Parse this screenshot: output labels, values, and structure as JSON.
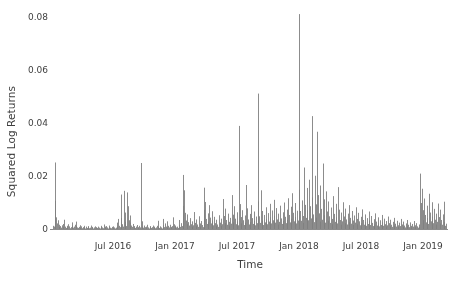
{
  "chart_data": {
    "type": "bar",
    "title": "",
    "xlabel": "Time",
    "ylabel": "Squared Log Returns",
    "ylim": [
      0,
      0.085
    ],
    "ytick_values": [
      0,
      0.02,
      0.04,
      0.06,
      0.08
    ],
    "ytick_labels": [
      "0",
      "0.02",
      "0.04",
      "0.06",
      "0.08"
    ],
    "xtick_labels": [
      "Jul 2016",
      "Jan 2017",
      "Jul 2017",
      "Jan 2018",
      "Jul 2018",
      "Jan 2019"
    ],
    "xtick_positions": [
      113,
      175,
      237,
      299,
      361,
      423
    ],
    "x_range_px": [
      53,
      446
    ],
    "grid": false,
    "legend": null,
    "series_color": "#7f7f7f",
    "axis_color": "#8c8c8c",
    "series": [
      {
        "name": "Squared Log Returns",
        "values": [
          0.0012,
          0.0009,
          0.0106,
          0.0251,
          0.0044,
          0.0021,
          0.0033,
          0.0016,
          0.0008,
          0.0011,
          0.0005,
          0.0014,
          0.0007,
          0.0019,
          0.0035,
          0.0009,
          0.0004,
          0.0012,
          0.0006,
          0.0018,
          0.001,
          0.0003,
          0.0007,
          0.0025,
          0.0013,
          0.0005,
          0.0009,
          0.0016,
          0.0028,
          0.0011,
          0.0006,
          0.0004,
          0.0008,
          0.0014,
          0.0005,
          0.001,
          0.0003,
          0.0007,
          0.0012,
          0.0006,
          0.0002,
          0.0009,
          0.0004,
          0.0011,
          0.0007,
          0.0003,
          0.0005,
          0.0013,
          0.0008,
          0.0004,
          0.0002,
          0.0006,
          0.001,
          0.0003,
          0.0007,
          0.0004,
          0.0009,
          0.0005,
          0.0002,
          0.0008,
          0.0012,
          0.0006,
          0.0003,
          0.0017,
          0.0009,
          0.0004,
          0.0011,
          0.0006,
          0.0002,
          0.0007,
          0.0013,
          0.0005,
          0.0003,
          0.0008,
          0.0004,
          0.001,
          0.0006,
          0.0002,
          0.0005,
          0.0009,
          0.0024,
          0.0038,
          0.0012,
          0.0007,
          0.013,
          0.0041,
          0.0018,
          0.0009,
          0.0144,
          0.0062,
          0.0027,
          0.0011,
          0.0138,
          0.0086,
          0.0033,
          0.0051,
          0.0024,
          0.0013,
          0.0008,
          0.0019,
          0.0006,
          0.0011,
          0.0004,
          0.0009,
          0.0015,
          0.0007,
          0.0003,
          0.0012,
          0.0006,
          0.0249,
          0.0029,
          0.001,
          0.0005,
          0.0013,
          0.0007,
          0.0003,
          0.0009,
          0.0016,
          0.0006,
          0.0002,
          0.0008,
          0.0011,
          0.0004,
          0.0007,
          0.0013,
          0.0005,
          0.0009,
          0.0003,
          0.0006,
          0.0012,
          0.0031,
          0.0008,
          0.0004,
          0.001,
          0.0006,
          0.0002,
          0.0038,
          0.0014,
          0.0007,
          0.0021,
          0.0009,
          0.0005,
          0.0029,
          0.0012,
          0.0006,
          0.0016,
          0.0008,
          0.0003,
          0.0011,
          0.0044,
          0.0018,
          0.0007,
          0.0013,
          0.0006,
          0.0009,
          0.0004,
          0.0034,
          0.0015,
          0.0008,
          0.0022,
          0.0011,
          0.0204,
          0.0087,
          0.0146,
          0.0061,
          0.0032,
          0.0019,
          0.0055,
          0.0026,
          0.0013,
          0.0041,
          0.0018,
          0.0009,
          0.0029,
          0.0014,
          0.0064,
          0.0023,
          0.0011,
          0.0036,
          0.0017,
          0.0008,
          0.0048,
          0.0021,
          0.001,
          0.003,
          0.0015,
          0.0007,
          0.0156,
          0.0072,
          0.0102,
          0.0038,
          0.0019,
          0.0059,
          0.0027,
          0.009,
          0.0043,
          0.0021,
          0.0067,
          0.0031,
          0.0014,
          0.0046,
          0.0022,
          0.0011,
          0.0035,
          0.0017,
          0.0008,
          0.0052,
          0.0024,
          0.0012,
          0.0039,
          0.0018,
          0.0113,
          0.0049,
          0.0023,
          0.0077,
          0.0034,
          0.0016,
          0.0058,
          0.0027,
          0.0013,
          0.0042,
          0.002,
          0.0128,
          0.0054,
          0.0025,
          0.0086,
          0.0039,
          0.0018,
          0.0063,
          0.0029,
          0.0014,
          0.0389,
          0.0094,
          0.0045,
          0.0021,
          0.0071,
          0.0033,
          0.0015,
          0.0051,
          0.0024,
          0.0166,
          0.0078,
          0.0036,
          0.0017,
          0.0057,
          0.0026,
          0.009,
          0.0041,
          0.0019,
          0.0066,
          0.003,
          0.0014,
          0.0047,
          0.0022,
          0.0511,
          0.0104,
          0.0048,
          0.0023,
          0.0146,
          0.0068,
          0.0032,
          0.0015,
          0.0053,
          0.0025,
          0.0082,
          0.0038,
          0.0018,
          0.006,
          0.0028,
          0.0095,
          0.0044,
          0.0021,
          0.007,
          0.0033,
          0.011,
          0.005,
          0.0024,
          0.0079,
          0.0036,
          0.0017,
          0.0058,
          0.0027,
          0.0088,
          0.004,
          0.0019,
          0.0063,
          0.003,
          0.01,
          0.0046,
          0.0022,
          0.0073,
          0.0034,
          0.0116,
          0.0053,
          0.0025,
          0.0084,
          0.0039,
          0.0135,
          0.0061,
          0.0029,
          0.0098,
          0.0045,
          0.0021,
          0.0069,
          0.0032,
          0.0811,
          0.0148,
          0.0068,
          0.0031,
          0.0108,
          0.0049,
          0.0023,
          0.0232,
          0.0091,
          0.0042,
          0.0155,
          0.0071,
          0.0033,
          0.0186,
          0.0086,
          0.004,
          0.0426,
          0.0119,
          0.0055,
          0.0026,
          0.0201,
          0.0093,
          0.0043,
          0.0367,
          0.0128,
          0.0059,
          0.0028,
          0.0164,
          0.0076,
          0.0035,
          0.0247,
          0.0112,
          0.0052,
          0.0024,
          0.0142,
          0.0066,
          0.0031,
          0.0104,
          0.0048,
          0.0023,
          0.0081,
          0.0038,
          0.0018,
          0.0124,
          0.0057,
          0.0027,
          0.0095,
          0.0044,
          0.0021,
          0.0158,
          0.0073,
          0.0034,
          0.0016,
          0.0062,
          0.0029,
          0.0101,
          0.0047,
          0.0022,
          0.0077,
          0.0036,
          0.0017,
          0.0058,
          0.0027,
          0.009,
          0.0042,
          0.002,
          0.0068,
          0.0032,
          0.0015,
          0.0051,
          0.0024,
          0.0082,
          0.0038,
          0.0018,
          0.0061,
          0.0029,
          0.0014,
          0.0046,
          0.0022,
          0.0074,
          0.0034,
          0.0016,
          0.0055,
          0.0026,
          0.0012,
          0.0041,
          0.0019,
          0.0066,
          0.0031,
          0.0015,
          0.0049,
          0.0023,
          0.0011,
          0.0037,
          0.0017,
          0.0059,
          0.0028,
          0.0013,
          0.0044,
          0.0021,
          0.001,
          0.0033,
          0.0015,
          0.0053,
          0.0025,
          0.0012,
          0.0039,
          0.0018,
          0.0009,
          0.003,
          0.0014,
          0.0047,
          0.0022,
          0.001,
          0.0035,
          0.0016,
          0.0008,
          0.0027,
          0.0012,
          0.0042,
          0.002,
          0.0009,
          0.0031,
          0.0014,
          0.0007,
          0.0024,
          0.0011,
          0.0038,
          0.0017,
          0.0008,
          0.0028,
          0.0013,
          0.0006,
          0.0021,
          0.001,
          0.0034,
          0.0016,
          0.0007,
          0.0025,
          0.0012,
          0.0006,
          0.0019,
          0.0009,
          0.003,
          0.0014,
          0.0007,
          0.0022,
          0.001,
          0.0005,
          0.0017,
          0.0008,
          0.0209,
          0.0098,
          0.0152,
          0.0071,
          0.0033,
          0.0115,
          0.0053,
          0.0025,
          0.0088,
          0.0041,
          0.0019,
          0.0133,
          0.0062,
          0.0029,
          0.0101,
          0.0047,
          0.0022,
          0.0076,
          0.0035,
          0.0017,
          0.0058,
          0.0027,
          0.0096,
          0.0045,
          0.0021,
          0.0073,
          0.0034,
          0.0016,
          0.0055,
          0.0026,
          0.0103,
          0.0012,
          0.002
        ]
      }
    ],
    "annotations": []
  },
  "axes": {
    "ylabel": "Squared Log Returns",
    "xlabel": "Time"
  }
}
